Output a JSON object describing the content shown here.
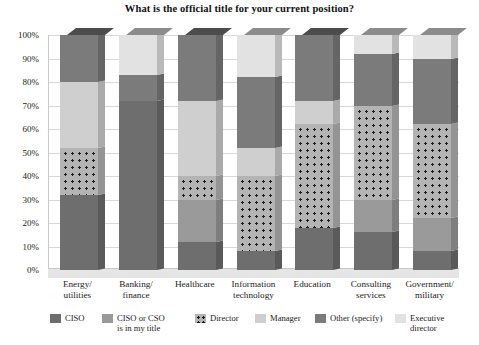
{
  "chart_data": {
    "type": "bar",
    "subtype": "stacked-100-percent-3d",
    "title": "What is the official title for your current position?",
    "xlabel": "",
    "ylabel": "",
    "ylim": [
      0,
      100
    ],
    "ytick_labels": [
      "0%",
      "10%",
      "20%",
      "30%",
      "40%",
      "50%",
      "60%",
      "70%",
      "80%",
      "90%",
      "100%"
    ],
    "ytick_values": [
      0,
      10,
      20,
      30,
      40,
      50,
      60,
      70,
      80,
      90,
      100
    ],
    "grid": true,
    "legend_position": "bottom",
    "categories": [
      "Energy/\nutilities",
      "Banking/\nfinance",
      "Healthcare",
      "Information\ntechnology",
      "Education",
      "Consulting\nservices",
      "Government/\nmilitary"
    ],
    "series": [
      {
        "name": "CISO",
        "color": "#6e6e6e",
        "pattern": "solid",
        "values": [
          32,
          72,
          12,
          8,
          18,
          16,
          8
        ]
      },
      {
        "name": "CISO or CSO\nis in my title",
        "color": "#9a9a9a",
        "pattern": "solid",
        "values": [
          0,
          0,
          18,
          0,
          0,
          14,
          14
        ]
      },
      {
        "name": "Director",
        "color": "#b4b4b4",
        "pattern": "dotted",
        "values": [
          20,
          0,
          10,
          32,
          44,
          40,
          40
        ]
      },
      {
        "name": "Manager",
        "color": "#cfcfcf",
        "pattern": "solid",
        "values": [
          28,
          0,
          32,
          12,
          10,
          0,
          0
        ]
      },
      {
        "name": "Other (specify)",
        "color": "#7b7b7b",
        "pattern": "solid",
        "values": [
          20,
          11,
          28,
          30,
          28,
          22,
          28
        ]
      },
      {
        "name": "Executive director",
        "color": "#e2e2e2",
        "pattern": "solid",
        "values": [
          0,
          17,
          0,
          18,
          0,
          8,
          10
        ]
      }
    ],
    "legend": [
      {
        "label": "CISO",
        "color": "#6e6e6e",
        "pattern": "solid"
      },
      {
        "label": "CISO or CSO\nis in my title",
        "color": "#9a9a9a",
        "pattern": "solid"
      },
      {
        "label": "Director",
        "color": "#b4b4b4",
        "pattern": "dotted"
      },
      {
        "label": "Manager",
        "color": "#cfcfcf",
        "pattern": "solid"
      },
      {
        "label": "Other (specify)",
        "color": "#7b7b7b",
        "pattern": "solid"
      },
      {
        "label": "Executive director",
        "color": "#e2e2e2",
        "pattern": "solid"
      }
    ]
  }
}
